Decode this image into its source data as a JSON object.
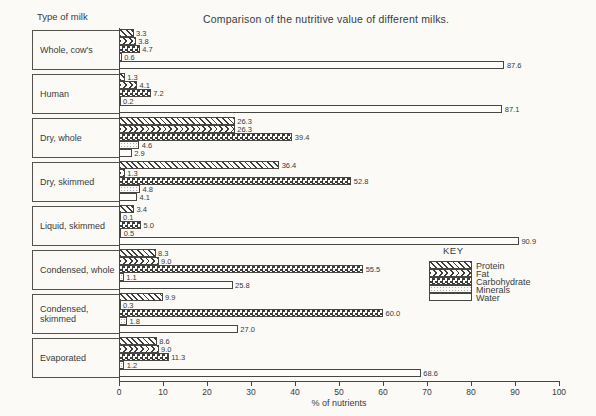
{
  "page": {
    "title": "Comparison of the nutritive value of different milks.",
    "left_header": "Type of milk",
    "key_title": "KEY",
    "xlabel": "% of nutrients",
    "ink_color": "#3a3a3a",
    "paper_color": "#fbfaf6"
  },
  "chart_data": {
    "type": "bar",
    "orientation": "horizontal",
    "title": "Comparison of the nutritive value of different milks.",
    "xlabel": "% of nutrients",
    "xlim": [
      0,
      100
    ],
    "xticks": [
      0,
      10,
      20,
      30,
      40,
      50,
      60,
      70,
      80,
      90,
      100
    ],
    "grid": false,
    "legend_position": "right-middle",
    "value_label_decimals": 1,
    "categories": [
      "Whole, cow's",
      "Human",
      "Dry, whole",
      "Dry, skimmed",
      "Liquid, skimmed",
      "Condensed, whole",
      "Condensed, skimmed",
      "Evaporated"
    ],
    "series": [
      {
        "name": "Protein",
        "pattern": "protein",
        "values": [
          3.3,
          1.3,
          26.3,
          36.4,
          3.4,
          8.3,
          9.9,
          8.6
        ]
      },
      {
        "name": "Fat",
        "pattern": "fat",
        "values": [
          3.8,
          4.1,
          26.3,
          1.3,
          0.1,
          9.0,
          0.3,
          9.0
        ]
      },
      {
        "name": "Carbohydrate",
        "pattern": "carbohydrate",
        "values": [
          4.7,
          7.2,
          39.4,
          52.8,
          5.0,
          55.5,
          60.0,
          11.3
        ]
      },
      {
        "name": "Minerals",
        "pattern": "minerals",
        "values": [
          0.6,
          0.2,
          4.6,
          4.8,
          0.5,
          1.1,
          1.8,
          1.2
        ]
      },
      {
        "name": "Water",
        "pattern": "water",
        "values": [
          87.6,
          87.1,
          2.9,
          4.1,
          90.9,
          25.8,
          27.0,
          68.6
        ]
      }
    ]
  }
}
